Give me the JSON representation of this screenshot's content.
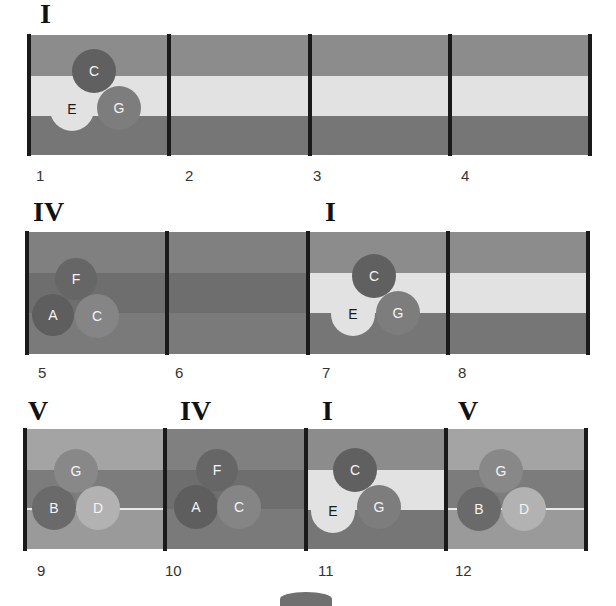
{
  "colors": {
    "band_top": "#8c8c8c",
    "band_mid_light": "#e2e2e2",
    "band_bottom": "#767676",
    "iv_top": "#808080",
    "iv_mid": "#6e6e6e",
    "iv_bottom": "#7a7a7a",
    "v_top": "#a4a4a4",
    "v_mid": "#7c7c7c",
    "v_bottom": "#9a9a9a",
    "bar": "#1a1a1a"
  },
  "rows": [
    {
      "chords": [
        {
          "roman": "I",
          "measure": 1
        }
      ],
      "measures": [
        "1",
        "2",
        "3",
        "4"
      ]
    },
    {
      "chords": [
        {
          "roman": "IV",
          "measure": 5
        },
        {
          "roman": "I",
          "measure": 7
        }
      ],
      "measures": [
        "5",
        "6",
        "7",
        "8"
      ]
    },
    {
      "chords": [
        {
          "roman": "V",
          "measure": 9
        },
        {
          "roman": "IV",
          "measure": 10
        },
        {
          "roman": "I",
          "measure": 11
        },
        {
          "roman": "V",
          "measure": 12
        }
      ],
      "measures": [
        "9",
        "10",
        "11",
        "12"
      ]
    }
  ],
  "chord_notes": {
    "I": [
      "C",
      "E",
      "G"
    ],
    "IV": [
      "F",
      "A",
      "C"
    ],
    "V": [
      "G",
      "B",
      "D"
    ]
  },
  "labels": {
    "row1_roman": "I",
    "row2_roman_a": "IV",
    "row2_roman_b": "I",
    "row3_roman_a": "V",
    "row3_roman_b": "IV",
    "row3_roman_c": "I",
    "row3_roman_d": "V",
    "m1": "1",
    "m2": "2",
    "m3": "3",
    "m4": "4",
    "m5": "5",
    "m6": "6",
    "m7": "7",
    "m8": "8",
    "m9": "9",
    "m10": "10",
    "m11": "11",
    "m12": "12",
    "note_c": "C",
    "note_e": "E",
    "note_g": "G",
    "note_f": "F",
    "note_a": "A",
    "note_b": "B",
    "note_d": "D"
  }
}
